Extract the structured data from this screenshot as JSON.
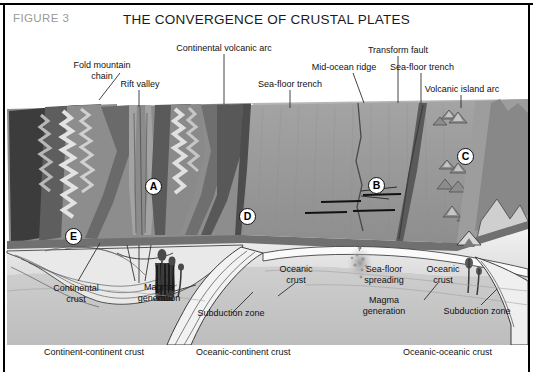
{
  "figure": {
    "tag": "FIGURE 3",
    "title": "THE CONVERGENCE OF CRUSTAL PLATES"
  },
  "colors": {
    "frame": "#000000",
    "figure_tag": "#9a9a9a",
    "title": "#1a1a1a",
    "ocean_surface": "#9a9a9a",
    "ocean_far": "#b0b0b0",
    "crust_light": "#e6e6e6",
    "mantle_gray": "#c9c9c9",
    "mountain_dark": "#4a4a4a",
    "mountain_mid": "#7d7d7d",
    "mountain_light": "#d5d5d5",
    "magma_dark": "#1c1c1c",
    "marker_fill": "#ffffff",
    "marker_text": "#000000"
  },
  "top_labels": [
    {
      "id": "fold-mountain-chain",
      "text_line1": "Fold mountain",
      "text_line2": "chain"
    },
    {
      "id": "rift-valley",
      "text_line1": "Rift valley",
      "text_line2": ""
    },
    {
      "id": "continental-volcanic-arc",
      "text_line1": "Continental volcanic arc",
      "text_line2": ""
    },
    {
      "id": "sea-floor-trench-left",
      "text_line1": "Sea-floor trench",
      "text_line2": ""
    },
    {
      "id": "mid-ocean-ridge",
      "text_line1": "Mid-ocean ridge",
      "text_line2": ""
    },
    {
      "id": "transform-fault",
      "text_line1": "Transform fault",
      "text_line2": ""
    },
    {
      "id": "sea-floor-trench-right",
      "text_line1": "Sea-floor trench",
      "text_line2": ""
    },
    {
      "id": "volcanic-island-arc",
      "text_line1": "Volcanic island arc",
      "text_line2": ""
    }
  ],
  "inner_labels": [
    {
      "id": "continental-crust",
      "text_line1": "Continental",
      "text_line2": "crust"
    },
    {
      "id": "magma-generation-left",
      "text_line1": "Magma",
      "text_line2": "generation"
    },
    {
      "id": "subduction-zone-left",
      "text_line1": "Subduction zone",
      "text_line2": ""
    },
    {
      "id": "oceanic-crust-left",
      "text_line1": "Oceanic",
      "text_line2": "crust"
    },
    {
      "id": "sea-floor-spreading",
      "text_line1": "Sea-floor",
      "text_line2": "spreading"
    },
    {
      "id": "magma-generation-right",
      "text_line1": "Magma",
      "text_line2": "generation"
    },
    {
      "id": "oceanic-crust-right",
      "text_line1": "Oceanic",
      "text_line2": "crust"
    },
    {
      "id": "subduction-zone-right",
      "text_line1": "Subduction zone",
      "text_line2": ""
    }
  ],
  "bottom_labels": [
    {
      "id": "continent-continent-crust",
      "text": "Continent-continent crust"
    },
    {
      "id": "oceanic-continent-crust",
      "text": "Oceanic-continent crust"
    },
    {
      "id": "oceanic-oceanic-crust",
      "text": "Oceanic-oceanic crust"
    }
  ],
  "markers": [
    {
      "id": "marker-a",
      "letter": "A"
    },
    {
      "id": "marker-b",
      "letter": "B"
    },
    {
      "id": "marker-c",
      "letter": "C"
    },
    {
      "id": "marker-d",
      "letter": "D"
    },
    {
      "id": "marker-e",
      "letter": "E"
    }
  ]
}
